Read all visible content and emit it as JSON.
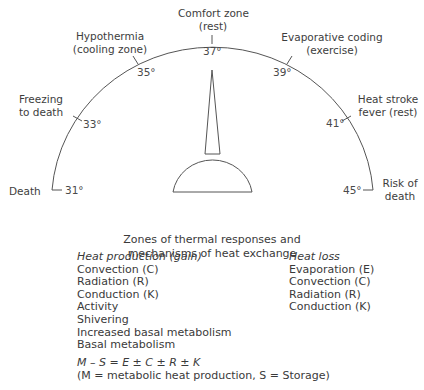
{
  "zones": {
    "comfort": {
      "line1": "Comfort zone",
      "line2": "(rest)"
    },
    "hypothermia": {
      "line1": "Hypothermia",
      "line2": "(cooling zone)"
    },
    "evaporative": {
      "line1": "Evaporative coding",
      "line2": "(exercise)"
    },
    "freezing": {
      "line1": "Freezing",
      "line2": "to death"
    },
    "heatstroke": {
      "line1": "Heat stroke",
      "line2": "fever (rest)"
    },
    "death": {
      "line1": "Death"
    },
    "risk": {
      "line1": "Risk of",
      "line2": "death"
    }
  },
  "ticks": {
    "t31": "31°",
    "t33": "33°",
    "t35": "35°",
    "t37": "37°",
    "t39": "39°",
    "t41": "41°",
    "t45": "45°"
  },
  "caption": {
    "line1": "Zones of thermal responses and",
    "line2": "mechanisms of heat exchange"
  },
  "heat_production": {
    "heading": "Heat production (gain)",
    "items": [
      "Convection (C)",
      "Radiation (R)",
      "Conduction (K)",
      "Activity",
      "Shivering",
      "Increased basal metabolism",
      "Basal metabolism"
    ]
  },
  "heat_loss": {
    "heading": "Heat loss",
    "items": [
      "Evaporation (E)",
      "Convection (C)",
      "Radiation (R)",
      "Conduction (K)"
    ]
  },
  "equation": {
    "formula": "M – S = E ± C ± R ± K",
    "legend": "(M = metabolic heat production, S = Storage)"
  }
}
